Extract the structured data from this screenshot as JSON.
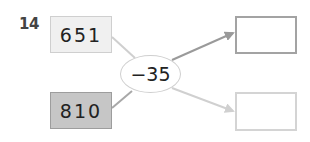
{
  "problem": {
    "number": "14",
    "inputs": [
      {
        "value": "651",
        "fill": "#f0f0f0",
        "border": "#cfcfcf"
      },
      {
        "value": "810",
        "fill": "#c6c6c6",
        "border": "#9d9d9d"
      }
    ],
    "operator": "−35",
    "outputs": [
      {
        "value": "",
        "border": "#a3a3a3"
      },
      {
        "value": "",
        "border": "#d4d4d4"
      }
    ]
  },
  "colors": {
    "line_light": "#cfcfcf",
    "arrow_dark": "#9a9a9a",
    "arrow_light": "#d0d0d0",
    "text": "#222222"
  }
}
